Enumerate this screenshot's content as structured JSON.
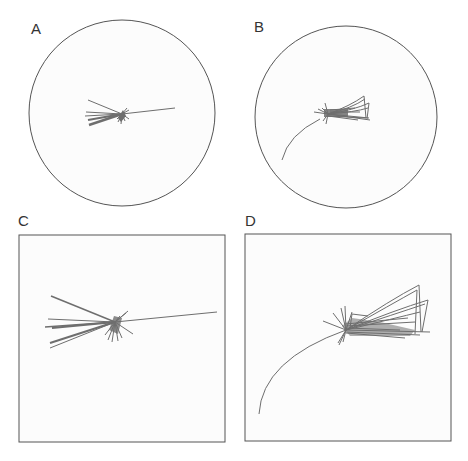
{
  "figure": {
    "panels": [
      {
        "id": "A",
        "label": "A",
        "shape": "circle",
        "cx": 122,
        "cy": 113,
        "r": 93,
        "label_x": 31,
        "label_y": 20
      },
      {
        "id": "B",
        "label": "B",
        "shape": "circle",
        "cx": 346,
        "cy": 117,
        "r": 91,
        "label_x": 254,
        "label_y": 18
      },
      {
        "id": "C",
        "label": "C",
        "shape": "square",
        "x": 19,
        "y": 235,
        "w": 206,
        "h": 207,
        "label_x": 18,
        "label_y": 213
      },
      {
        "id": "D",
        "label": "D",
        "shape": "square",
        "x": 245,
        "y": 234,
        "w": 206,
        "h": 207,
        "label_x": 245,
        "label_y": 213
      }
    ],
    "colors": {
      "border": "#555555",
      "trajectory": "#6e6e6e",
      "background": "#ffffff",
      "panel_fill": "#fcfcfc"
    }
  }
}
